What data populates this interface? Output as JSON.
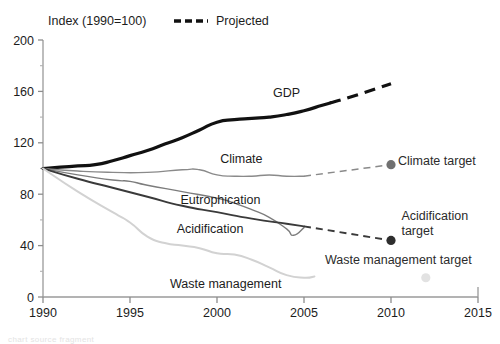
{
  "chart_data": {
    "type": "line",
    "title": "",
    "subtitle": "",
    "ylabel": "Index (1990=100)",
    "xlabel": "",
    "grid": false,
    "xlim": [
      1990,
      2015
    ],
    "ylim": [
      0,
      200
    ],
    "xticks": [
      1990,
      1995,
      2000,
      2005,
      2010,
      2015
    ],
    "xtick_labels": [
      "1990",
      "1995",
      "2000",
      "2005",
      "2010",
      "2015"
    ],
    "yticks": [
      0,
      40,
      80,
      120,
      160,
      200
    ],
    "ytick_labels": [
      "0",
      "40",
      "80",
      "120",
      "160",
      "200"
    ],
    "yminor_ticks": [
      20,
      60,
      100,
      140,
      180
    ],
    "legend": {
      "position": "top",
      "entries": [
        {
          "label": "Projected",
          "style": "dashed",
          "color": "#111111"
        }
      ]
    },
    "series": [
      {
        "name": "GDP",
        "color": "#111111",
        "width": 3.2,
        "label": "GDP",
        "label_x": 2004.0,
        "label_y": 156,
        "historical": [
          {
            "x": 1990,
            "y": 100
          },
          {
            "x": 1991,
            "y": 101
          },
          {
            "x": 1992,
            "y": 102
          },
          {
            "x": 1993,
            "y": 103
          },
          {
            "x": 1994,
            "y": 106
          },
          {
            "x": 1995,
            "y": 110
          },
          {
            "x": 1996,
            "y": 114
          },
          {
            "x": 1997,
            "y": 119
          },
          {
            "x": 1998,
            "y": 124
          },
          {
            "x": 1999,
            "y": 130
          },
          {
            "x": 2000,
            "y": 136
          },
          {
            "x": 2001,
            "y": 138
          },
          {
            "x": 2002,
            "y": 139
          },
          {
            "x": 2003,
            "y": 140
          },
          {
            "x": 2004,
            "y": 142
          },
          {
            "x": 2005,
            "y": 145
          },
          {
            "x": 2006,
            "y": 149
          },
          {
            "x": 2006.5,
            "y": 151
          }
        ],
        "projected": [
          {
            "x": 2006.5,
            "y": 151
          },
          {
            "x": 2008,
            "y": 157
          },
          {
            "x": 2010,
            "y": 166
          }
        ]
      },
      {
        "name": "Climate",
        "color": "#8a8a8a",
        "width": 1.4,
        "label": "Climate",
        "label_x": 2001.4,
        "label_y": 104,
        "historical": [
          {
            "x": 1990,
            "y": 100
          },
          {
            "x": 1992,
            "y": 98
          },
          {
            "x": 1994,
            "y": 97
          },
          {
            "x": 1996,
            "y": 97
          },
          {
            "x": 1998,
            "y": 99
          },
          {
            "x": 1999,
            "y": 99
          },
          {
            "x": 2000,
            "y": 95
          },
          {
            "x": 2001,
            "y": 94
          },
          {
            "x": 2002,
            "y": 94
          },
          {
            "x": 2003,
            "y": 95
          },
          {
            "x": 2004,
            "y": 94
          },
          {
            "x": 2005,
            "y": 94
          }
        ],
        "projected": [
          {
            "x": 2005,
            "y": 94
          },
          {
            "x": 2010,
            "y": 103
          }
        ],
        "target": {
          "x": 2010,
          "y": 103,
          "label": "Climate target",
          "color": "#707070"
        }
      },
      {
        "name": "Eutrophication",
        "color": "#7c7c7c",
        "width": 1.4,
        "label": "Eutrophication",
        "label_x": 2000.2,
        "label_y": 72,
        "historical": [
          {
            "x": 1990,
            "y": 100
          },
          {
            "x": 1992,
            "y": 95
          },
          {
            "x": 1994,
            "y": 91
          },
          {
            "x": 1995,
            "y": 90
          },
          {
            "x": 1996,
            "y": 87
          },
          {
            "x": 1998,
            "y": 82
          },
          {
            "x": 2000,
            "y": 77
          },
          {
            "x": 2001,
            "y": 73
          },
          {
            "x": 2002,
            "y": 68
          },
          {
            "x": 2003,
            "y": 62
          },
          {
            "x": 2004,
            "y": 53
          },
          {
            "x": 2004.4,
            "y": 48
          },
          {
            "x": 2005,
            "y": 54
          }
        ],
        "projected": [],
        "target": null
      },
      {
        "name": "Acidification",
        "color": "#3a3a3a",
        "width": 1.9,
        "label": "Acidification",
        "label_x": 1999.6,
        "label_y": 50,
        "historical": [
          {
            "x": 1990,
            "y": 100
          },
          {
            "x": 1992,
            "y": 92
          },
          {
            "x": 1994,
            "y": 85
          },
          {
            "x": 1996,
            "y": 78
          },
          {
            "x": 1998,
            "y": 71
          },
          {
            "x": 2000,
            "y": 66
          },
          {
            "x": 2002,
            "y": 61
          },
          {
            "x": 2004,
            "y": 57
          },
          {
            "x": 2005,
            "y": 55
          }
        ],
        "projected": [
          {
            "x": 2005,
            "y": 55
          },
          {
            "x": 2010,
            "y": 44
          }
        ],
        "target": {
          "x": 2010,
          "y": 44,
          "label": "Acidification target",
          "color": "#2e2e2e"
        }
      },
      {
        "name": "Waste management",
        "color": "#d2d2d2",
        "width": 2.0,
        "label": "Waste management",
        "label_x": 2000.5,
        "label_y": 7,
        "historical": [
          {
            "x": 1990,
            "y": 100
          },
          {
            "x": 1992,
            "y": 82
          },
          {
            "x": 1994,
            "y": 66
          },
          {
            "x": 1995,
            "y": 58
          },
          {
            "x": 1996,
            "y": 47
          },
          {
            "x": 1997,
            "y": 42
          },
          {
            "x": 1998,
            "y": 40
          },
          {
            "x": 1999,
            "y": 38
          },
          {
            "x": 2000,
            "y": 34
          },
          {
            "x": 2001,
            "y": 33
          },
          {
            "x": 2002,
            "y": 29
          },
          {
            "x": 2003,
            "y": 23
          },
          {
            "x": 2004,
            "y": 17
          },
          {
            "x": 2005,
            "y": 15
          },
          {
            "x": 2005.6,
            "y": 16
          }
        ],
        "projected": [],
        "target": {
          "x": 2012,
          "y": 15,
          "label": "Waste management target",
          "color": "#e2e2e2"
        }
      }
    ],
    "annotations": [
      {
        "text": "Climate target",
        "x": 2010.4,
        "y": 103,
        "anchor": "start"
      },
      {
        "text": "Acidification",
        "x": 2010.6,
        "y": 60,
        "anchor": "start"
      },
      {
        "text": "target",
        "x": 2010.6,
        "y": 48,
        "anchor": "start"
      },
      {
        "text": "Waste management target",
        "x": 2006.2,
        "y": 26,
        "anchor": "start"
      }
    ]
  },
  "legend": {
    "index_note": "Index (1990=100)",
    "projected_label": "Projected"
  },
  "footer": {
    "ghost_text": "chart source fragment"
  }
}
